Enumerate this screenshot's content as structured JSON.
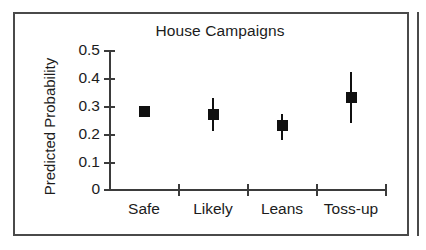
{
  "figure": {
    "title": "House Campaigns",
    "ylabel": "Predicted Probability"
  },
  "axes": {
    "y_ticks": [
      "0.5",
      "0.4",
      "0.3",
      "0.2",
      "0.1",
      "0"
    ],
    "x_ticks": [
      "Safe",
      "Likely",
      "Leans",
      "Toss-up"
    ]
  },
  "chart_data": {
    "type": "scatter",
    "title": "House Campaigns",
    "subtitle": "",
    "xlabel": "",
    "ylabel": "Predicted Probability",
    "categories": [
      "Safe",
      "Likely",
      "Leans",
      "Toss-up"
    ],
    "values": [
      0.28,
      0.27,
      0.23,
      0.33
    ],
    "error_low": [
      0.26,
      0.21,
      0.18,
      0.24
    ],
    "error_high": [
      0.3,
      0.33,
      0.27,
      0.42
    ],
    "ylim": [
      0,
      0.5
    ],
    "ytick_values": [
      0,
      0.1,
      0.2,
      0.3,
      0.4,
      0.5
    ],
    "ytick_labels": [
      "0",
      "0.1",
      "0.2",
      "0.3",
      "0.4",
      "0.5"
    ],
    "grid": false,
    "legend": false,
    "marker": "square",
    "marker_color": "#101010",
    "errorbar_color": "#101010",
    "axis_color": "#3b3b3b",
    "background": "#ffffff",
    "points": [
      {
        "category": "Safe",
        "value": 0.28,
        "ci_low": 0.26,
        "ci_high": 0.3
      },
      {
        "category": "Likely",
        "value": 0.27,
        "ci_low": 0.21,
        "ci_high": 0.33
      },
      {
        "category": "Leans",
        "value": 0.23,
        "ci_low": 0.18,
        "ci_high": 0.27
      },
      {
        "category": "Toss-up",
        "value": 0.33,
        "ci_low": 0.24,
        "ci_high": 0.42
      }
    ]
  }
}
